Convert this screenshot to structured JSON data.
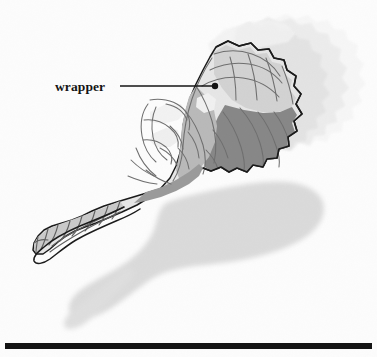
{
  "figure": {
    "background_color": "#fcfcfc",
    "callout": {
      "label": "wrapper",
      "label_x": 55,
      "label_y": 91,
      "leader_line": {
        "x1": 120,
        "y1": 86,
        "x2": 213,
        "y2": 86
      },
      "dot": {
        "cx": 215,
        "cy": 86,
        "r": 3.2
      },
      "color": "#141414"
    },
    "rule": {
      "name": "bottom-rule",
      "x": 5,
      "y": 343,
      "width": 367,
      "height": 6,
      "color": "#141414"
    },
    "colors": {
      "outline": "#1a1a1a",
      "paper": "#fcfcfc",
      "wrapper_light": "#e8e8e8",
      "wrapper_mid": "#cfcfcf",
      "wrapper_midtone": "#bdbdbd",
      "wrapper_dark": "#8b8b8b",
      "wrapper_darker": "#787878",
      "shadow": "#d9d9d9",
      "ghost_1": "#e2e2e2",
      "ghost_2": "#ededed",
      "ghost_3": "#f5f5f5",
      "crease": "#9a9a9a"
    },
    "elements": [
      {
        "name": "wrapped-object",
        "description": "crinkled plastic wrapper enclosing a rounded object, twisted closed at lower-left tail"
      },
      {
        "name": "motion-trail",
        "description": "three faded scalloped ghost copies trailing to the right"
      },
      {
        "name": "cast-shadow",
        "description": "soft grey shadow on ground, offset down and right"
      },
      {
        "name": "scalloped-edge",
        "description": "serrated fan-shaped open edge at right of wrapper"
      },
      {
        "name": "twisted-tail",
        "description": "segmented twisted end of wrapper at lower left"
      }
    ]
  }
}
